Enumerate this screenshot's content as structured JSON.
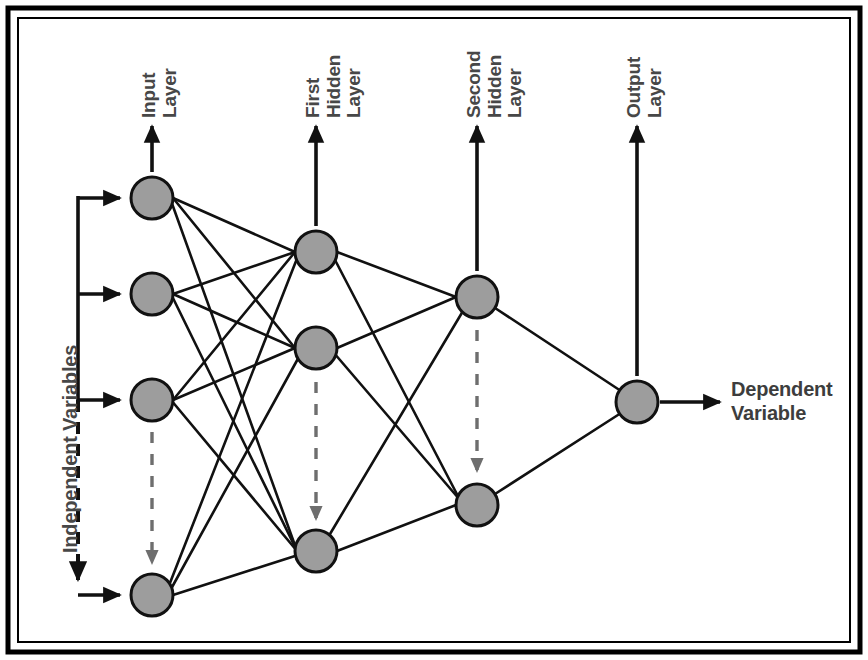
{
  "diagram": {
    "type": "neural-network",
    "colors": {
      "node_fill": "#9d9d9d",
      "node_stroke": "#111111",
      "edge": "#111111",
      "label_text": "#474747",
      "ellipsis": "#6e6e6e",
      "frame": "#000000",
      "background": "#ffffff"
    },
    "frame": {
      "outer": {
        "x": 8,
        "y": 8,
        "width": 852,
        "height": 644
      },
      "inner": {
        "x": 18,
        "y": 18,
        "width": 832,
        "height": 624
      }
    },
    "labels": {
      "input_layer": "Input\nLayer",
      "first_hidden_layer": "First\nHidden\nLayer",
      "second_hidden_layer": "Second\nHidden\nLayer",
      "output_layer": "Output\nLayer",
      "independent_variables": "Independent Variables",
      "dependent_variable": "Dependent\nVariable"
    },
    "layers": [
      {
        "id": "input",
        "name": "Input Layer",
        "label": "Input\nLayer",
        "x": 152,
        "node_count_visible": 4,
        "has_ellipsis": true,
        "nodes": [
          {
            "cx": 152,
            "cy": 198,
            "r": 21
          },
          {
            "cx": 152,
            "cy": 294,
            "r": 21
          },
          {
            "cx": 152,
            "cy": 400,
            "r": 21
          },
          {
            "cx": 152,
            "cy": 595,
            "r": 21
          }
        ],
        "ellipsis_arrow": {
          "x": 152,
          "y1": 432,
          "y2": 568
        },
        "label_arrow": {
          "x": 152,
          "y1": 170,
          "y2": 122
        },
        "label_pos": {
          "x": 138,
          "y": 118
        }
      },
      {
        "id": "hidden1",
        "name": "First Hidden Layer",
        "label": "First\nHidden\nLayer",
        "x": 316,
        "node_count_visible": 3,
        "has_ellipsis": true,
        "nodes": [
          {
            "cx": 316,
            "cy": 252,
            "r": 21
          },
          {
            "cx": 316,
            "cy": 348,
            "r": 21
          },
          {
            "cx": 316,
            "cy": 551,
            "r": 21
          }
        ],
        "ellipsis_arrow": {
          "x": 316,
          "y1": 382,
          "y2": 522
        },
        "label_arrow": {
          "x": 316,
          "y1": 224,
          "y2": 122
        },
        "label_pos": {
          "x": 302,
          "y": 118
        }
      },
      {
        "id": "hidden2",
        "name": "Second Hidden Layer",
        "label": "Second\nHidden\nLayer",
        "x": 477,
        "node_count_visible": 2,
        "has_ellipsis": true,
        "nodes": [
          {
            "cx": 477,
            "cy": 297,
            "r": 21
          },
          {
            "cx": 477,
            "cy": 505,
            "r": 21
          }
        ],
        "ellipsis_arrow": {
          "x": 477,
          "y1": 330,
          "y2": 474
        },
        "label_arrow": {
          "x": 477,
          "y1": 269,
          "y2": 122
        },
        "label_pos": {
          "x": 463,
          "y": 118
        }
      },
      {
        "id": "output",
        "name": "Output Layer",
        "label": "Output\nLayer",
        "x": 637,
        "node_count_visible": 1,
        "has_ellipsis": false,
        "nodes": [
          {
            "cx": 637,
            "cy": 402,
            "r": 21
          }
        ],
        "label_arrow": {
          "x": 637,
          "y1": 374,
          "y2": 122
        },
        "label_pos": {
          "x": 623,
          "y": 118
        }
      }
    ],
    "connections": [
      {
        "from": "input",
        "to": "hidden1",
        "pattern": "fully-connected",
        "count": 12
      },
      {
        "from": "hidden1",
        "to": "hidden2",
        "pattern": "fully-connected",
        "count": 6
      },
      {
        "from": "hidden2",
        "to": "output",
        "pattern": "fully-connected",
        "count": 2
      }
    ],
    "input_bracket": {
      "x": 78,
      "solid_y1": 196,
      "solid_y2": 400,
      "dashed_y1": 400,
      "dashed_y2": 588,
      "arrow_rows": [
        198,
        294,
        400,
        595
      ],
      "arrow_tip_x": 126,
      "label_pos": {
        "x": 52,
        "y": 520
      }
    },
    "output_arrow": {
      "x1": 660,
      "x2": 726,
      "y": 402,
      "label_pos": {
        "x": 735,
        "y": 378
      }
    }
  }
}
